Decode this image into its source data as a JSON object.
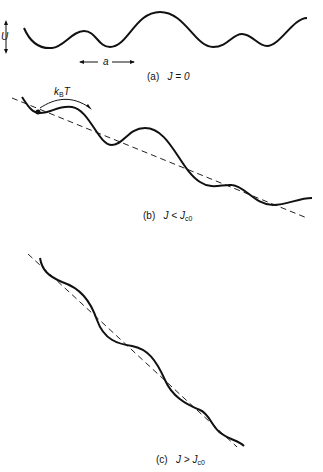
{
  "panels": [
    {
      "id": "a",
      "caption_tag": "(a)",
      "caption_math": "J = 0",
      "annotations": {
        "amplitude_label": "U",
        "period_label": "a"
      }
    },
    {
      "id": "b",
      "caption_tag": "(b)",
      "caption_math_left": "J <",
      "caption_math_right": "J",
      "caption_sub": "c0",
      "annotations": {
        "thermal_label": "k",
        "thermal_sub": "B",
        "thermal_tail": "T"
      }
    },
    {
      "id": "c",
      "caption_tag": "(c)",
      "caption_math_left": "J >",
      "caption_math_right": "J",
      "caption_sub": "c0"
    }
  ],
  "colors": {
    "curve": "#111111",
    "dashed": "#222222",
    "background": "#ffffff"
  }
}
